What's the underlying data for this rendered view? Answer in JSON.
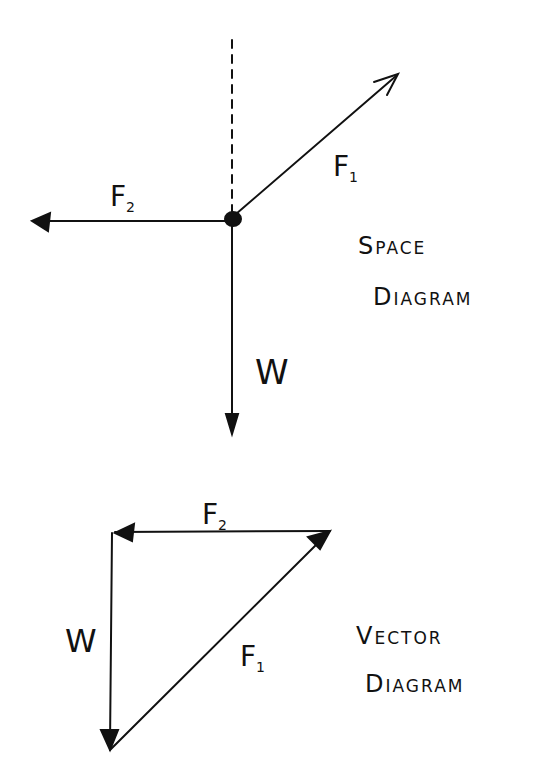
{
  "space_diagram": {
    "title_line1_initial": "S",
    "title_line1_rest": "PACE",
    "title_line2_initial": "D",
    "title_line2_rest": "IAGRAM",
    "labels": {
      "f1_main": "F",
      "f1_sub": "1",
      "f2_main": "F",
      "f2_sub": "2",
      "w": "W"
    }
  },
  "vector_diagram": {
    "title_line1_initial": "V",
    "title_line1_rest": "ECTOR",
    "title_line2_initial": "D",
    "title_line2_rest": "IAGRAM",
    "labels": {
      "f1_main": "F",
      "f1_sub": "1",
      "f2_main": "F",
      "f2_sub": "2",
      "w": "W"
    }
  },
  "colors": {
    "ink": "#111111",
    "background": "#ffffff"
  }
}
